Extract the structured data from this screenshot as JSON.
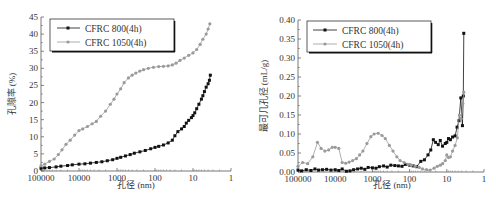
{
  "chart_data": [
    {
      "type": "line",
      "title": "",
      "xlabel": "孔径 (nm)",
      "ylabel": "孔隙率 (%)",
      "xscale": "log",
      "xreversed": true,
      "xlim": [
        100000,
        1
      ],
      "ylim": [
        0,
        45
      ],
      "xticks": [
        "100000",
        "10000",
        "1000",
        "100",
        "10",
        "1"
      ],
      "yticks": [
        "0",
        "5",
        "10",
        "15",
        "20",
        "25",
        "30",
        "35",
        "40",
        "45"
      ],
      "grid": false,
      "legend_position": "upper left",
      "legend": [
        "CFRC 800(4h)",
        "CFRC 1050(4h)"
      ],
      "series": [
        {
          "name": "CFRC 800(4h)",
          "color": "#111111",
          "marker": "square",
          "x": [
            100000,
            80000,
            60000,
            40000,
            30000,
            20000,
            15000,
            10000,
            7000,
            5000,
            3500,
            2500,
            1800,
            1300,
            1000,
            800,
            600,
            450,
            350,
            250,
            180,
            130,
            100,
            80,
            60,
            45,
            35,
            30,
            25,
            20,
            17,
            15,
            13,
            11,
            10,
            9,
            8,
            7,
            6,
            5.5,
            5,
            4.5,
            4,
            3.7,
            3.5
          ],
          "values": [
            0.8,
            0.9,
            1.0,
            1.2,
            1.4,
            1.6,
            1.8,
            2.0,
            2.1,
            2.3,
            2.5,
            2.7,
            3.0,
            3.3,
            3.7,
            4.0,
            4.4,
            4.8,
            5.2,
            5.6,
            6.0,
            6.5,
            6.9,
            7.2,
            7.6,
            8.2,
            9.0,
            10.3,
            11.5,
            12.3,
            13.0,
            14.0,
            14.8,
            15.6,
            16.2,
            17.0,
            18.2,
            19.5,
            21.0,
            22.0,
            23.2,
            24.5,
            25.5,
            26.5,
            28.0
          ]
        },
        {
          "name": "CFRC 1050(4h)",
          "color": "#9a9a9a",
          "marker": "circle",
          "x": [
            100000,
            80000,
            60000,
            45000,
            35000,
            28000,
            22000,
            17000,
            13000,
            10000,
            8000,
            6000,
            4500,
            3500,
            2700,
            2000,
            1500,
            1200,
            1000,
            800,
            650,
            500,
            400,
            320,
            250,
            200,
            150,
            110,
            80,
            60,
            45,
            35,
            28,
            22,
            17,
            13,
            10,
            8,
            6.5,
            5.5,
            4.5,
            4,
            3.6
          ],
          "values": [
            1.5,
            2.0,
            2.8,
            3.5,
            4.8,
            6.2,
            7.8,
            9.0,
            10.5,
            11.8,
            12.3,
            13.0,
            13.8,
            14.5,
            16.0,
            17.5,
            19.5,
            21.0,
            22.5,
            24.0,
            25.8,
            27.2,
            28.0,
            28.6,
            29.2,
            29.6,
            30.0,
            30.3,
            30.5,
            30.6,
            30.7,
            31.0,
            31.5,
            32.3,
            33.0,
            33.8,
            34.5,
            35.5,
            37.0,
            38.5,
            40.0,
            41.5,
            43.0
          ]
        }
      ]
    },
    {
      "type": "line",
      "title": "",
      "xlabel": "孔径 (nm)",
      "ylabel": "最可几孔径 (mL/g)",
      "xscale": "log",
      "xreversed": true,
      "xlim": [
        100000,
        1
      ],
      "ylim": [
        0,
        0.4
      ],
      "xticks": [
        "100000",
        "10000",
        "1000",
        "100",
        "10",
        "1"
      ],
      "yticks": [
        "0.00",
        "0.05",
        "0.10",
        "0.15",
        "0.20",
        "0.25",
        "0.30",
        "0.35",
        "0.40"
      ],
      "grid": false,
      "legend_position": "upper left",
      "legend": [
        "CFRC 800(4h)",
        "CFRC 1050(4h)"
      ],
      "series": [
        {
          "name": "CFRC 800(4h)",
          "color": "#111111",
          "marker": "square",
          "x": [
            100000,
            80000,
            60000,
            45000,
            35000,
            28000,
            22000,
            17000,
            13000,
            10000,
            8000,
            6500,
            5000,
            4000,
            3200,
            2500,
            2000,
            1600,
            1300,
            1000,
            800,
            650,
            500,
            400,
            320,
            250,
            200,
            160,
            130,
            100,
            80,
            65,
            50,
            40,
            32,
            27,
            23,
            20,
            17,
            15,
            13,
            11,
            10,
            9,
            8,
            7,
            6,
            5.3,
            4.7,
            4.2,
            3.8,
            3.6,
            3.5
          ],
          "values": [
            0.005,
            0.003,
            0.006,
            0.004,
            0.008,
            0.005,
            0.006,
            0.007,
            0.005,
            0.006,
            0.004,
            0.008,
            0.002,
            0.003,
            0.006,
            0.008,
            0.01,
            0.007,
            0.012,
            0.011,
            0.01,
            0.014,
            0.016,
            0.013,
            0.018,
            0.017,
            0.016,
            0.015,
            0.02,
            0.018,
            0.016,
            0.014,
            0.028,
            0.032,
            0.045,
            0.058,
            0.085,
            0.078,
            0.072,
            0.083,
            0.068,
            0.075,
            0.078,
            0.088,
            0.085,
            0.092,
            0.095,
            0.118,
            0.135,
            0.195,
            0.122,
            0.2,
            0.365
          ]
        },
        {
          "name": "CFRC 1050(4h)",
          "color": "#9a9a9a",
          "marker": "circle",
          "x": [
            100000,
            75000,
            55000,
            40000,
            30000,
            24000,
            19000,
            15000,
            12000,
            10000,
            8000,
            6500,
            5200,
            4200,
            3400,
            2700,
            2200,
            1800,
            1400,
            1100,
            900,
            700,
            550,
            450,
            350,
            280,
            220,
            180,
            140,
            110,
            90,
            70,
            55,
            45,
            35,
            28,
            22,
            18,
            15,
            13,
            11,
            10,
            9,
            8,
            7,
            6,
            5.2,
            4.6,
            4.1,
            3.7,
            3.5
          ],
          "values": [
            0.015,
            0.025,
            0.022,
            0.04,
            0.078,
            0.062,
            0.055,
            0.058,
            0.065,
            0.065,
            0.062,
            0.025,
            0.023,
            0.026,
            0.03,
            0.035,
            0.045,
            0.055,
            0.075,
            0.093,
            0.1,
            0.102,
            0.096,
            0.088,
            0.07,
            0.055,
            0.04,
            0.03,
            0.025,
            0.02,
            0.018,
            0.015,
            0.012,
            0.008,
            0.006,
            0.005,
            0.01,
            0.015,
            0.018,
            0.022,
            0.03,
            0.045,
            0.038,
            0.04,
            0.055,
            0.07,
            0.09,
            0.15,
            0.14,
            0.18,
            0.21
          ]
        }
      ]
    }
  ],
  "charts": {
    "left": {
      "ylabel": "孔隙率 (%)",
      "xlabel": "孔径 (nm)",
      "legend": [
        "CFRC 800(4h)",
        "CFRC 1050(4h)"
      ]
    },
    "right": {
      "ylabel": "最可几孔径 (mL/g)",
      "xlabel": "孔径 (nm)",
      "legend": [
        "CFRC 800(4h)",
        "CFRC 1050(4h)"
      ]
    }
  }
}
